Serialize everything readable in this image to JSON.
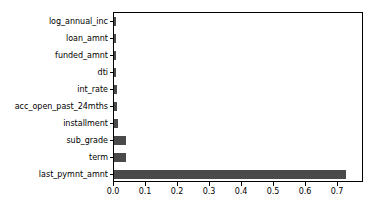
{
  "chart_data": {
    "type": "bar",
    "orientation": "horizontal",
    "title": "",
    "xlabel": "",
    "ylabel": "",
    "categories": [
      "log_annual_inc",
      "loan_amnt",
      "funded_amnt",
      "dti",
      "int_rate",
      "acc_open_past_24mths",
      "installment",
      "sub_grade",
      "term",
      "last_pymnt_amnt"
    ],
    "values": [
      0.006,
      0.006,
      0.007,
      0.007,
      0.009,
      0.009,
      0.012,
      0.037,
      0.037,
      0.725
    ],
    "xlim": [
      0.0,
      0.781
    ],
    "ylim_categories": 10,
    "xticks": [
      0.0,
      0.1,
      0.2,
      0.3,
      0.4,
      0.5,
      0.6,
      0.7
    ],
    "xticklabels": [
      "0.0",
      "0.1",
      "0.2",
      "0.3",
      "0.4",
      "0.5",
      "0.6",
      "0.7"
    ],
    "grid": false,
    "legend": null,
    "bar_color": "#4a4a4a",
    "background_color": "#ffffff",
    "axis_color": "#000000"
  }
}
